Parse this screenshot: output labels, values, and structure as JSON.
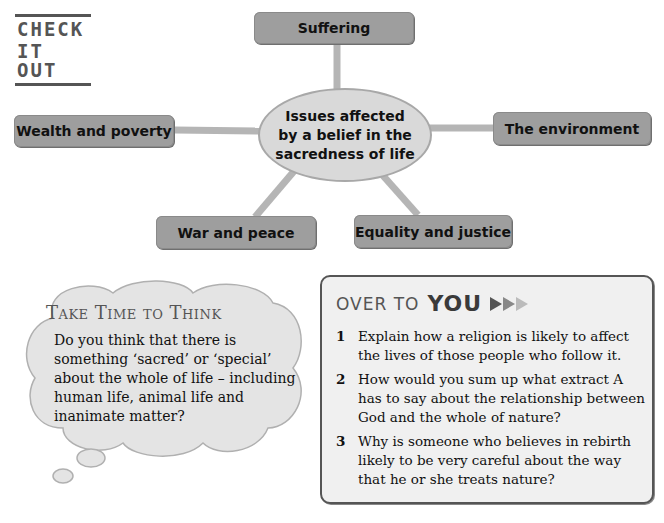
{
  "check_it_out": {
    "line1": "CHECK",
    "line2": "IT OUT"
  },
  "spider_diagram": {
    "center": "Issues affected by a belief in the sacredness of life",
    "nodes": {
      "top": "Suffering",
      "left": "Wealth and poverty",
      "right": "The environment",
      "bottom_left": "War and peace",
      "bottom_right": "Equality and justice"
    }
  },
  "take_time": {
    "title": "Take Time to Think",
    "body": "Do you think that there is something ‘sacred’ or ‘special’ about the whole of life – including human life, animal life and inanimate matter?"
  },
  "over_to_you": {
    "title_light": "OVER TO",
    "title_bold": "YOU",
    "questions": [
      {
        "num": "1",
        "text": "Explain how a religion is likely to affect the lives of those people who follow it."
      },
      {
        "num": "2",
        "text": "How would you sum up what extract A has to say about the relationship between God and the whole of nature?"
      },
      {
        "num": "3",
        "text": "Why is someone who believes in rebirth likely to be very careful about the way that he or she treats nature?"
      }
    ]
  },
  "colors": {
    "node_fill": "#9e9e9e",
    "hub_fill": "#d9d9d9",
    "box_fill": "#f0f0f0",
    "border": "#555555"
  }
}
